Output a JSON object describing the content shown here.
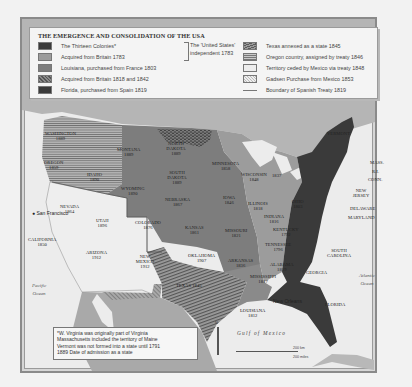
{
  "map": {
    "title": "THE EMERGENCE AND CONSOLIDATION OF THE USA",
    "legend": {
      "items": [
        {
          "key": "thirteen_colonies",
          "label": "The Thirteen Colonies*",
          "color": "#3a3a3a"
        },
        {
          "key": "britain_1783",
          "label": "Acquired from Britain 1783",
          "color": "#9c9c9c"
        },
        {
          "key": "louisiana_1803",
          "label": "Louisiana, purchased from France 1803",
          "color": "#7d7d7d"
        },
        {
          "key": "britain_1818_1842",
          "label": "Acquired from Britain 1818 and 1842",
          "pattern": "dotted-dark"
        },
        {
          "key": "florida_1819",
          "label": "Florida, purchased from Spain 1819",
          "color": "#3a3a3a"
        },
        {
          "key": "texas_1845",
          "label": "Texas annexed as a state 1845",
          "pattern": "diagonal-hatch"
        },
        {
          "key": "oregon_1846",
          "label": "Oregon country, assigned by treaty 1846",
          "pattern": "horizontal-hatch"
        },
        {
          "key": "mexico_1848",
          "label": "Territory ceded by Mexico via treaty 1848",
          "color": "#ededed"
        },
        {
          "key": "gadsden_1853",
          "label": "Gadsen Purchase from Mexico 1853",
          "pattern": "light-dotted"
        },
        {
          "key": "spanish_treaty_1819",
          "label": "Boundary of Spanish Treaty 1819",
          "pattern": "line"
        }
      ],
      "bracket_note_line1": "The 'United States'",
      "bracket_note_line2": "independent 1783"
    },
    "states": [
      {
        "name": "WASHINGTON",
        "year": "1889"
      },
      {
        "name": "OREGON",
        "year": "1859"
      },
      {
        "name": "IDAHO",
        "year": "1890"
      },
      {
        "name": "MONTANA",
        "year": "1889"
      },
      {
        "name": "WYOMING",
        "year": "1890"
      },
      {
        "name": "NEVADA",
        "year": "1864"
      },
      {
        "name": "UTAH",
        "year": "1896"
      },
      {
        "name": "CALIFORNIA",
        "year": "1850"
      },
      {
        "name": "ARIZONA",
        "year": "1912"
      },
      {
        "name": "COLORADO",
        "year": "1876"
      },
      {
        "name": "NEW MEXICO",
        "year": "1912"
      },
      {
        "name": "NORTH DAKOTA",
        "year": "1889"
      },
      {
        "name": "SOUTH DAKOTA",
        "year": "1889"
      },
      {
        "name": "NEBRASKA",
        "year": "1867"
      },
      {
        "name": "KANSAS",
        "year": "1861"
      },
      {
        "name": "OKLAHOMA",
        "year": "1907"
      },
      {
        "name": "TEXAS",
        "year": "1845"
      },
      {
        "name": "MINNESOTA",
        "year": "1858"
      },
      {
        "name": "IOWA",
        "year": "1846"
      },
      {
        "name": "MISSOURI",
        "year": "1821"
      },
      {
        "name": "ARKANSAS",
        "year": "1836"
      },
      {
        "name": "LOUISIANA",
        "year": "1812"
      },
      {
        "name": "WISCONSIN",
        "year": "1848"
      },
      {
        "name": "ILLINOIS",
        "year": "1818"
      },
      {
        "name": "MICHIGAN",
        "year": "1837"
      },
      {
        "name": "INDIANA",
        "year": "1816"
      },
      {
        "name": "OHIO",
        "year": "1803"
      },
      {
        "name": "KENTUCKY",
        "year": "1792"
      },
      {
        "name": "TENNESSEE",
        "year": "1796"
      },
      {
        "name": "MISSISSIPPI",
        "year": "1817"
      },
      {
        "name": "ALABAMA",
        "year": "1819"
      },
      {
        "name": "VERMONT",
        "year": ""
      },
      {
        "name": "MASS.",
        "year": ""
      },
      {
        "name": "R.I.",
        "year": ""
      },
      {
        "name": "CONN.",
        "year": ""
      },
      {
        "name": "NEW JERSEY",
        "year": ""
      },
      {
        "name": "DELAWARE",
        "year": ""
      },
      {
        "name": "MARYLAND",
        "year": ""
      },
      {
        "name": "SOUTH CAROLINA",
        "year": ""
      },
      {
        "name": "GEORGIA",
        "year": ""
      },
      {
        "name": "FLORIDA",
        "year": ""
      }
    ],
    "cities": {
      "san_francisco": "San Francisco",
      "new_orleans": "New Orleans"
    },
    "water": {
      "pacific_1": "Pacific",
      "pacific_2": "Ocean",
      "atlantic_1": "Atlantic",
      "atlantic_2": "Ocean",
      "gulf": "Gulf of Mexico"
    },
    "scale": {
      "km": "200 km",
      "miles": "200 miles"
    },
    "compass": "N",
    "footnote": {
      "line1": "*W. Virginia was originally part of Virginia",
      "line2": "Massachusetts included the territory of Maine",
      "line3": "Vermont was not formed into a state until 1791",
      "line4": "1889 Date of admission as a state"
    }
  }
}
